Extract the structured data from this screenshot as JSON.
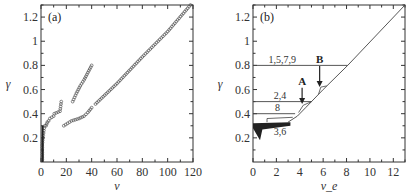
{
  "chart_data": [
    {
      "type": "scatter",
      "panel_label": "(a)",
      "xlabel": "ν",
      "ylabel": "γ",
      "xlim": [
        0,
        120
      ],
      "ylim": [
        0,
        1.3
      ],
      "xticks": [
        "0",
        "20",
        "40",
        "60",
        "80",
        "100",
        "120"
      ],
      "yticks": [
        "0.2",
        "0.4",
        "0.6",
        "0.8",
        "1",
        "1.2"
      ],
      "series": [
        {
          "name": "near-vertical cluster",
          "points": [
            [
              1,
              0.02
            ],
            [
              1,
              0.08
            ],
            [
              1,
              0.14
            ],
            [
              1.5,
              0.2
            ],
            [
              2,
              0.24
            ],
            [
              2.5,
              0.28
            ],
            [
              3,
              0.3
            ]
          ]
        },
        {
          "name": "small segments",
          "points": [
            [
              4,
              0.3
            ],
            [
              5,
              0.33
            ],
            [
              6,
              0.34
            ],
            [
              7,
              0.36
            ],
            [
              10,
              0.38
            ],
            [
              10.5,
              0.4
            ],
            [
              15,
              0.42
            ],
            [
              15.5,
              0.46
            ],
            [
              16,
              0.5
            ]
          ]
        },
        {
          "name": "steep segment",
          "points": [
            [
              25,
              0.5
            ],
            [
              28,
              0.57
            ],
            [
              31,
              0.63
            ],
            [
              34,
              0.68
            ],
            [
              37,
              0.74
            ],
            [
              40,
              0.8
            ]
          ]
        },
        {
          "name": "lower branch",
          "points": [
            [
              18,
              0.3
            ],
            [
              21,
              0.32
            ],
            [
              24,
              0.34
            ],
            [
              30,
              0.36
            ],
            [
              34,
              0.38
            ],
            [
              37,
              0.41
            ],
            [
              40,
              0.45
            ]
          ]
        },
        {
          "name": "diagonal",
          "points": [
            [
              43,
              0.48
            ],
            [
              60,
              0.65
            ],
            [
              80,
              0.87
            ],
            [
              100,
              1.08
            ],
            [
              118,
              1.3
            ]
          ]
        }
      ]
    },
    {
      "type": "line",
      "panel_label": "(b)",
      "xlabel": "ν_e",
      "ylabel": "γ",
      "xlim": [
        0,
        13
      ],
      "ylim": [
        0,
        1.3
      ],
      "xticks": [
        "0",
        "2",
        "4",
        "6",
        "8",
        "10",
        "12"
      ],
      "yticks": [
        "0.2",
        "0.4",
        "0.6",
        "0.8",
        "1",
        "1.2"
      ],
      "series": [
        {
          "name": "1,5,7,9",
          "points": [
            [
              0,
              0.8
            ],
            [
              8.1,
              0.8
            ]
          ]
        },
        {
          "name": "2,4",
          "points": [
            [
              0,
              0.5
            ],
            [
              5,
              0.5
            ]
          ]
        },
        {
          "name": "8",
          "points": [
            [
              0,
              0.4
            ],
            [
              3.6,
              0.4
            ]
          ]
        },
        {
          "name": "3,6",
          "points": [
            [
              0,
              0.3
            ],
            [
              3,
              0.32
            ]
          ]
        },
        {
          "name": "envelope",
          "points": [
            [
              3,
              0.33
            ],
            [
              3.8,
              0.38
            ],
            [
              4.5,
              0.45
            ],
            [
              6,
              0.6
            ],
            [
              8.1,
              0.8
            ],
            [
              13,
              1.3
            ]
          ]
        }
      ],
      "annotations": [
        {
          "text": "1,5,7,9",
          "x": 2.5,
          "y": 0.82
        },
        {
          "text": "2,4",
          "x": 2.3,
          "y": 0.52
        },
        {
          "text": "8",
          "x": 2.1,
          "y": 0.42
        },
        {
          "text": "3,6",
          "x": 2.3,
          "y": 0.22
        },
        {
          "text": "A",
          "x": 4.2,
          "y": 0.64,
          "arrow_to": [
            4.2,
            0.48
          ]
        },
        {
          "text": "B",
          "x": 5.7,
          "y": 0.82,
          "arrow_to": [
            5.7,
            0.62
          ]
        }
      ]
    }
  ]
}
